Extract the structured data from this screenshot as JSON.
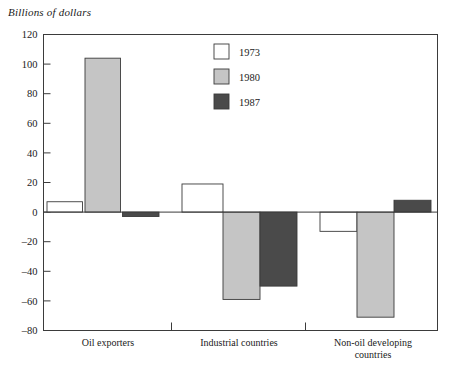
{
  "chart_data": {
    "type": "bar",
    "title": "Billions of dollars",
    "xlabel": "",
    "ylabel": "Billions of dollars",
    "ylim": [
      -80,
      120
    ],
    "ytick_step": 20,
    "yticks": [
      120,
      100,
      80,
      60,
      40,
      20,
      0,
      -20,
      -40,
      -60,
      -80
    ],
    "ytick_labels": [
      "120",
      "100",
      "80",
      "60",
      "40",
      "20",
      "0",
      "–20",
      "–40",
      "–60",
      "–80"
    ],
    "grid": false,
    "legend_position": "top-center",
    "categories": [
      "Oil exporters",
      "Industrial countries",
      "Non-oil developing countries"
    ],
    "category_label_lines": [
      [
        "Oil exporters"
      ],
      [
        "Industrial countries"
      ],
      [
        "Non-oil  developing",
        "countries"
      ]
    ],
    "series": [
      {
        "name": "1973",
        "color": "#ffffff",
        "values": [
          7,
          19,
          -13
        ]
      },
      {
        "name": "1980",
        "color": "#c5c5c5",
        "values": [
          104,
          -59,
          -71
        ]
      },
      {
        "name": "1987",
        "color": "#4a4a4a",
        "values": [
          -3,
          -50,
          8
        ]
      }
    ]
  },
  "legend": {
    "entries": [
      {
        "label": "1973",
        "color": "#ffffff"
      },
      {
        "label": "1980",
        "color": "#c5c5c5"
      },
      {
        "label": "1987",
        "color": "#4a4a4a"
      }
    ]
  },
  "axis": {
    "title": "Billions of dollars",
    "tick_labels": [
      "120",
      "100",
      "80",
      "60",
      "40",
      "20",
      "0",
      "–20",
      "–40",
      "–60",
      "–80"
    ]
  },
  "colors": {
    "series_1973": "#ffffff",
    "series_1980": "#c5c5c5",
    "series_1987": "#4a4a4a",
    "axis_stroke": "#3b3b3b",
    "text": "#1a1a1a",
    "background": "#ffffff"
  }
}
